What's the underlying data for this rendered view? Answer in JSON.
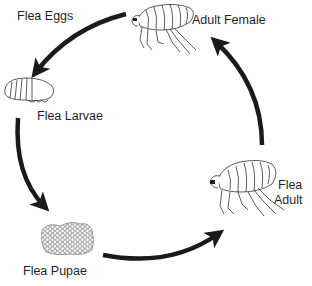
{
  "diagram": {
    "stages": [
      {
        "id": "eggs",
        "label": "Flea Eggs"
      },
      {
        "id": "larvae",
        "label": "Flea Larvae"
      },
      {
        "id": "pupae",
        "label": "Flea Pupae"
      },
      {
        "id": "adult",
        "label_line1": "Flea",
        "label_line2": "Adult"
      },
      {
        "id": "adult-female",
        "label": "Adult Female"
      }
    ],
    "cycle_order": [
      "Adult Female",
      "Flea Eggs",
      "Flea Larvae",
      "Flea Pupae",
      "Flea Adult",
      "Adult Female"
    ],
    "colors": {
      "arrow": "#1a1a1a",
      "line_art": "#333333",
      "background": "#ffffff"
    }
  }
}
